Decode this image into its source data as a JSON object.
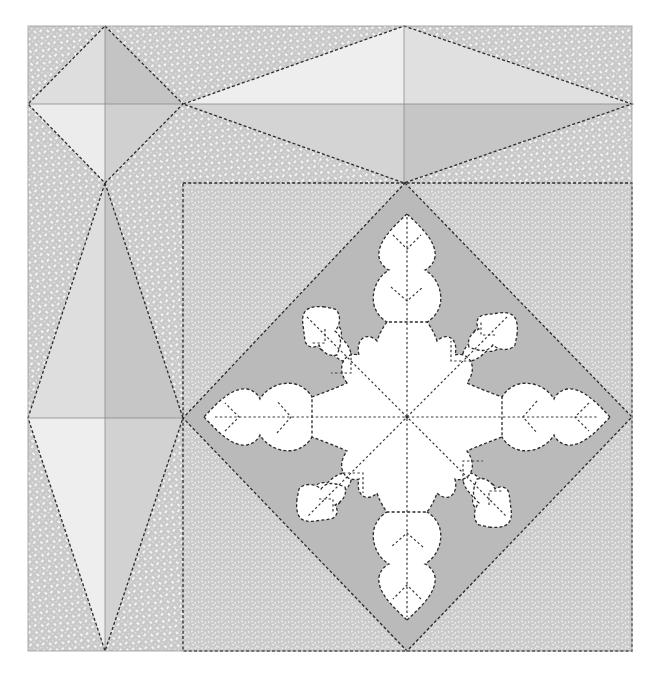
{
  "diagram": {
    "type": "quilt-block-layout",
    "canvas": {
      "width": 655,
      "height": 675
    },
    "bounds": {
      "left": 28,
      "top": 26,
      "right": 632,
      "bottom": 651
    },
    "colors": {
      "background_fabric": "#c9c9c9",
      "background_fabric_dots": "#f4f4f4",
      "block_fabric": "#cbcbcb",
      "block_fabric_speckle": "#f2f2f2",
      "diamond_fill": "#b9b9b9",
      "kite_very_light": "#ececec",
      "kite_light": "#dedede",
      "kite_medium": "#d0d0d0",
      "kite_dark": "#c2c2c2",
      "snowflake": "#ffffff",
      "stitch_line": "#2a2a2a",
      "seam_line": "#8a8a8a"
    },
    "pieces": [
      {
        "name": "corner-square",
        "x": 28,
        "y": 26,
        "w": 155,
        "h": 157,
        "motif": "four-quadrant diamond"
      },
      {
        "name": "top-border-strip",
        "x": 183,
        "y": 26,
        "w": 449,
        "h": 157,
        "motif": "elongated horizontal kite"
      },
      {
        "name": "left-border-strip",
        "x": 28,
        "y": 183,
        "w": 155,
        "h": 468,
        "motif": "elongated vertical kite"
      },
      {
        "name": "center-block",
        "x": 183,
        "y": 183,
        "w": 449,
        "h": 468,
        "motif": "on-point square with snowflake applique"
      }
    ],
    "snowflake": {
      "center": [
        407,
        417
      ],
      "arms": 8,
      "long_arm_leaves": 2,
      "diagonal_arm_leaves": 1
    }
  }
}
